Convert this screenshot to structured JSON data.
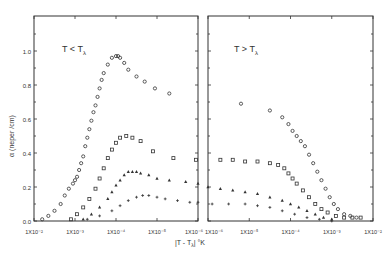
{
  "chart_data": [
    {
      "type": "scatter",
      "title": "",
      "panel_label": "T < Tλ",
      "xlabel": "|T - Tλ| °K",
      "ylabel": "α (neper /cm)",
      "xscale": "log",
      "x_reversed": true,
      "xlim": [
        0.01,
        1e-06
      ],
      "ylim": [
        0.0,
        1.2
      ],
      "y_ticks": [
        "0.0",
        "0.2",
        "0.4",
        "0.6",
        "0.8",
        "1.0"
      ],
      "x_ticks": [
        "1X10⁻²",
        "1X10⁻³",
        "1X10⁻⁴",
        "1X10⁻⁵",
        "1X10⁻⁶"
      ],
      "grid": false,
      "series": [
        {
          "name": "circles",
          "marker": "circle",
          "log10_x": [
            -2.2,
            -2.35,
            -2.5,
            -2.65,
            -2.75,
            -2.85,
            -2.95,
            -3.0,
            -3.05,
            -3.1,
            -3.15,
            -3.2,
            -3.25,
            -3.3,
            -3.35,
            -3.4,
            -3.45,
            -3.5,
            -3.55,
            -3.6,
            -3.65,
            -3.7,
            -3.8,
            -3.9,
            -4.0,
            -4.05,
            -4.1,
            -4.2,
            -4.3,
            -4.5,
            -4.7,
            -4.95,
            -5.3
          ],
          "values": [
            0.01,
            0.03,
            0.06,
            0.1,
            0.15,
            0.19,
            0.22,
            0.24,
            0.26,
            0.3,
            0.34,
            0.38,
            0.44,
            0.49,
            0.54,
            0.59,
            0.64,
            0.68,
            0.73,
            0.78,
            0.83,
            0.87,
            0.92,
            0.96,
            0.97,
            0.97,
            0.96,
            0.93,
            0.89,
            0.85,
            0.82,
            0.78,
            0.75
          ]
        },
        {
          "name": "squares",
          "marker": "square",
          "log10_x": [
            -2.9,
            -3.05,
            -3.2,
            -3.35,
            -3.5,
            -3.6,
            -3.7,
            -3.8,
            -3.9,
            -4.0,
            -4.1,
            -4.25,
            -4.4,
            -4.6,
            -4.9,
            -5.4,
            -5.95
          ],
          "values": [
            0.01,
            0.04,
            0.08,
            0.13,
            0.19,
            0.25,
            0.31,
            0.37,
            0.42,
            0.46,
            0.49,
            0.5,
            0.49,
            0.47,
            0.41,
            0.37,
            0.36
          ]
        },
        {
          "name": "triangles",
          "marker": "triangle",
          "log10_x": [
            -3.2,
            -3.4,
            -3.6,
            -3.8,
            -3.9,
            -4.0,
            -4.1,
            -4.2,
            -4.3,
            -4.4,
            -4.5,
            -4.6,
            -4.8,
            -5.0,
            -5.3,
            -5.7,
            -6.0
          ],
          "values": [
            0.01,
            0.04,
            0.08,
            0.13,
            0.17,
            0.21,
            0.24,
            0.27,
            0.29,
            0.29,
            0.29,
            0.28,
            0.27,
            0.25,
            0.24,
            0.23,
            0.22
          ]
        },
        {
          "name": "plus",
          "marker": "plus",
          "log10_x": [
            -3.3,
            -3.6,
            -3.9,
            -4.1,
            -4.3,
            -4.5,
            -4.65,
            -4.8,
            -5.0,
            -5.2,
            -5.5,
            -5.8,
            -6.0
          ],
          "values": [
            0.01,
            0.03,
            0.06,
            0.09,
            0.12,
            0.14,
            0.15,
            0.15,
            0.14,
            0.13,
            0.12,
            0.11,
            0.11
          ]
        }
      ]
    },
    {
      "type": "scatter",
      "title": "",
      "panel_label": "T > Tλ",
      "xlabel": "|T - Tλ| °K",
      "ylabel": "",
      "xscale": "log",
      "x_reversed": false,
      "xlim": [
        1e-06,
        0.01
      ],
      "ylim": [
        0.0,
        1.2
      ],
      "x_ticks": [
        "1X10⁻⁶",
        "1X10⁻⁵",
        "1X10⁻⁴",
        "1X10⁻³",
        "1X10⁻²"
      ],
      "grid": false,
      "series": [
        {
          "name": "circles",
          "marker": "circle",
          "log10_x": [
            -5.2,
            -4.5,
            -4.2,
            -4.05,
            -3.95,
            -3.85,
            -3.75,
            -3.65,
            -3.55,
            -3.45,
            -3.35,
            -3.25,
            -3.15,
            -3.05,
            -2.95,
            -2.85,
            -2.7,
            -2.55,
            -2.4
          ],
          "values": [
            0.69,
            0.65,
            0.61,
            0.57,
            0.53,
            0.5,
            0.47,
            0.44,
            0.39,
            0.34,
            0.29,
            0.24,
            0.19,
            0.14,
            0.1,
            0.07,
            0.04,
            0.03,
            0.02
          ]
        },
        {
          "name": "squares",
          "marker": "square",
          "log10_x": [
            -5.7,
            -5.4,
            -5.1,
            -4.8,
            -4.5,
            -4.3,
            -4.15,
            -4.05,
            -3.95,
            -3.85,
            -3.7,
            -3.55,
            -3.4,
            -3.25,
            -3.1,
            -2.9,
            -2.7,
            -2.5,
            -2.3
          ],
          "values": [
            0.36,
            0.36,
            0.35,
            0.35,
            0.34,
            0.33,
            0.31,
            0.28,
            0.25,
            0.22,
            0.18,
            0.14,
            0.1,
            0.07,
            0.05,
            0.03,
            0.02,
            0.02,
            0.02
          ]
        },
        {
          "name": "triangles",
          "marker": "triangle",
          "log10_x": [
            -6.0,
            -5.7,
            -5.4,
            -5.1,
            -4.8,
            -4.5,
            -4.2,
            -4.0,
            -3.8,
            -3.6,
            -3.4,
            -3.2,
            -3.0
          ],
          "values": [
            0.2,
            0.19,
            0.18,
            0.17,
            0.16,
            0.14,
            0.12,
            0.1,
            0.08,
            0.06,
            0.04,
            0.02,
            0.01
          ]
        },
        {
          "name": "plus",
          "marker": "plus",
          "log10_x": [
            -5.9,
            -5.5,
            -5.1,
            -4.8,
            -4.5,
            -4.2,
            -3.9,
            -3.6,
            -3.3,
            -3.0
          ],
          "values": [
            0.1,
            0.1,
            0.1,
            0.09,
            0.08,
            0.06,
            0.04,
            0.02,
            0.01,
            0.0
          ]
        }
      ]
    }
  ],
  "figure": {
    "ink_color": "#333333",
    "panel_label_left": "T < T",
    "panel_label_left_sub": "λ",
    "panel_label_right": "T > T",
    "panel_label_right_sub": "λ",
    "ylabel": "α (neper /cm)",
    "xlabel": "|T - T",
    "xlabel_sub": "λ",
    "xlabel_unit": "| °K"
  }
}
